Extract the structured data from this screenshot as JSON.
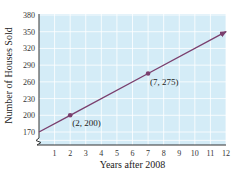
{
  "chart_data": {
    "type": "line",
    "title": "",
    "xlabel": "Years after 2008",
    "ylabel": "Number of Houses Sold",
    "x_ticks": [
      1,
      2,
      3,
      4,
      5,
      6,
      7,
      8,
      9,
      10,
      11,
      12
    ],
    "y_ticks": [
      170,
      200,
      230,
      260,
      290,
      320,
      350,
      380
    ],
    "xlim": [
      0,
      12
    ],
    "ylim": [
      140,
      380
    ],
    "y_axis_break": true,
    "grid": true,
    "legend": null,
    "series": [
      {
        "name": "Houses sold",
        "x": [
          0,
          2,
          7,
          12
        ],
        "y": [
          170,
          200,
          275,
          350
        ],
        "arrow_end": true
      }
    ],
    "marked_points": [
      {
        "x": 2,
        "y": 200,
        "label": "(2, 200)"
      },
      {
        "x": 7,
        "y": 275,
        "label": "(7, 275)"
      }
    ]
  },
  "colors": {
    "plot_background": "#d4ecf7",
    "grid": "#ffffff",
    "line": "#7a3f6e",
    "marker": "#7a3f6e",
    "axis": "#333333"
  }
}
